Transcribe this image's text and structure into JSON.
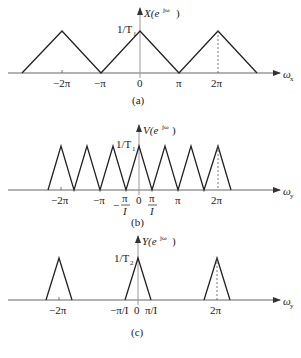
{
  "panels": [
    {
      "id": "a",
      "caption": "(a)",
      "y_label_base": "X(e",
      "y_label_sup": "jω",
      "y_label_sup_sub": "x",
      "y_label_close": ")",
      "peak_label": "1/T",
      "peak_label_sub": "1",
      "x_axis_label": "ω",
      "x_axis_sub": "x",
      "ticks": [
        "−2π",
        "−π",
        "0",
        "π",
        "2π"
      ]
    },
    {
      "id": "b",
      "caption": "(b)",
      "y_label_base": "V(e",
      "y_label_sup": "jω",
      "y_label_sup_sub": "y",
      "y_label_close": ")",
      "peak_label": "1/T",
      "peak_label_sub": "1",
      "x_axis_label": "ω",
      "x_axis_sub": "y",
      "ticks": [
        "−2π",
        "−π",
        "−π/I",
        "0",
        "π/I",
        "π",
        "2π"
      ]
    },
    {
      "id": "c",
      "caption": "(c)",
      "y_label_base": "Y(e",
      "y_label_sup": "jω",
      "y_label_sup_sub": "y",
      "y_label_close": ")",
      "peak_label": "1/T",
      "peak_label_sub": "2",
      "x_axis_label": "ω",
      "x_axis_sub": "y",
      "ticks": [
        "−2π",
        "−π/I 0 π/I",
        "2π"
      ]
    }
  ],
  "labels": {
    "a_tick_m2pi": "−2π",
    "a_tick_mpi": "−π",
    "a_tick_0": "0",
    "a_tick_pi": "π",
    "a_tick_2pi": "2π",
    "b_tick_m2pi": "−2π",
    "b_tick_mpi": "−π",
    "b_tick_minus": "−",
    "b_tick_pi_num": "π",
    "b_tick_I": "I",
    "b_tick_0": "0",
    "b_tick_pi": "π",
    "b_tick_2pi": "2π",
    "c_tick_m2pi": "−2π",
    "c_tick_center": "−π/I  0  π/I",
    "c_tick_2pi": "2π"
  }
}
